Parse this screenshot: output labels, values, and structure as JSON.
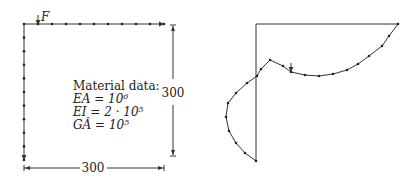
{
  "left_panel": {
    "force_label": "F",
    "material_title": "Material data:",
    "material_lines": [
      "EA = 10⁶",
      "EI = 2 · 10⁵",
      "GÂ = 10⁵"
    ],
    "height_dim": "300",
    "width_dim": "300",
    "top_beam_nodes": 10,
    "column_nodes": 10
  },
  "right_panel": {
    "description": "deformed frame shape",
    "curve_nodes": 24
  },
  "colors": {
    "line": "#333333",
    "node": "#222222"
  }
}
